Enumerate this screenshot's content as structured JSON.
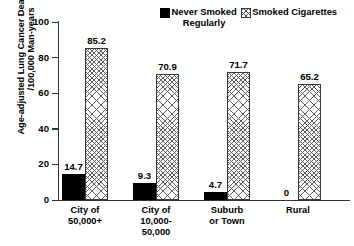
{
  "chart_data": {
    "type": "bar",
    "title": "",
    "xlabel": "",
    "ylabel_line1": "Age-adjusted Lung Cancer Death Rates",
    "ylabel_line2": "/100,000 Man-years",
    "ylim": [
      0,
      100
    ],
    "yticks": [
      0,
      20,
      40,
      60,
      80,
      100
    ],
    "ytick_labels": [
      "0",
      "20",
      "40",
      "60",
      "80",
      "100"
    ],
    "grid": false,
    "legend_position": "top-right",
    "categories": [
      "City of 50,000+",
      "City of 10,000-50,000",
      "Suburb or Town",
      "Rural"
    ],
    "category_lines": [
      [
        "City of",
        "50,000+"
      ],
      [
        "City of",
        "10,000-",
        "50,000"
      ],
      [
        "Suburb",
        "or Town"
      ],
      [
        "Rural"
      ]
    ],
    "series": [
      {
        "name": "Never Smoked Regularly",
        "name_line1": "Never Smoked",
        "name_line2": "Regularly",
        "pattern": "solid-black",
        "color": "#000000",
        "values": [
          14.7,
          9.3,
          4.7,
          0
        ],
        "value_labels": [
          "14.7",
          "9.3",
          "4.7",
          "0"
        ]
      },
      {
        "name": "Smoked Cigarettes",
        "name_line1": "Smoked Cigarettes",
        "name_line2": "",
        "pattern": "cross-hatch",
        "color": "#ffffff",
        "values": [
          85.2,
          70.9,
          71.7,
          65.2
        ],
        "value_labels": [
          "85.2",
          "70.9",
          "71.7",
          "65.2"
        ]
      }
    ]
  }
}
